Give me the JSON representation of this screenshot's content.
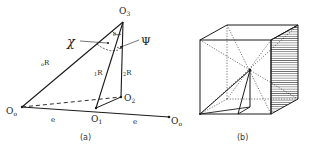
{
  "figure_a": {
    "caption": "(a)",
    "points": {
      "O3": {
        "label": "O",
        "sub": "3"
      },
      "O0_left": {
        "label": "O",
        "sub": "o"
      },
      "O1": {
        "label": "O",
        "sub": "1"
      },
      "O2": {
        "label": "O",
        "sub": "2"
      },
      "O0_right": {
        "label": "O",
        "sub": "o"
      }
    },
    "edges": {
      "oR": {
        "pre": "o",
        "main": "R"
      },
      "1R": {
        "pre": "1",
        "main": "R"
      },
      "2R": {
        "pre": "2",
        "main": "R"
      }
    },
    "angles": {
      "chi": "χ",
      "psi": "Ψ",
      "theta": "θ"
    },
    "distances": {
      "e_left": "e",
      "e_right": "e"
    }
  },
  "figure_b": {
    "caption": "(b)"
  },
  "colors": {
    "ink": "#1a1a1a",
    "background": "#ffffff"
  }
}
